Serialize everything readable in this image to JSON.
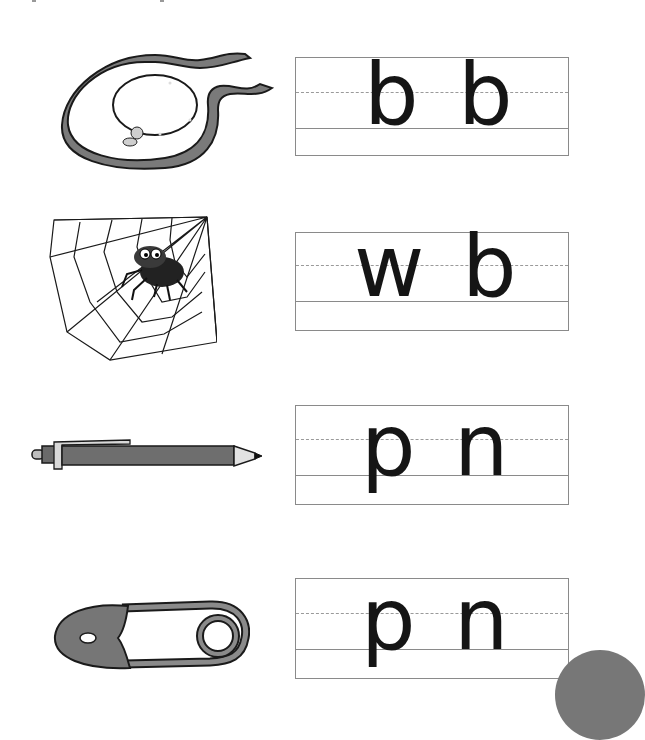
{
  "worksheet": {
    "rows": [
      {
        "picture": "bib-icon",
        "letters": [
          "b",
          "b"
        ]
      },
      {
        "picture": "spider-web-icon",
        "letters": [
          "w",
          "b"
        ]
      },
      {
        "picture": "pen-icon",
        "letters": [
          "p",
          "n"
        ]
      },
      {
        "picture": "safety-pin-icon",
        "letters": [
          "p",
          "n"
        ]
      }
    ]
  },
  "colors": {
    "ink": "#151515",
    "fill_gray": "#7a7a7a",
    "line_gray": "#8a8a8a"
  }
}
